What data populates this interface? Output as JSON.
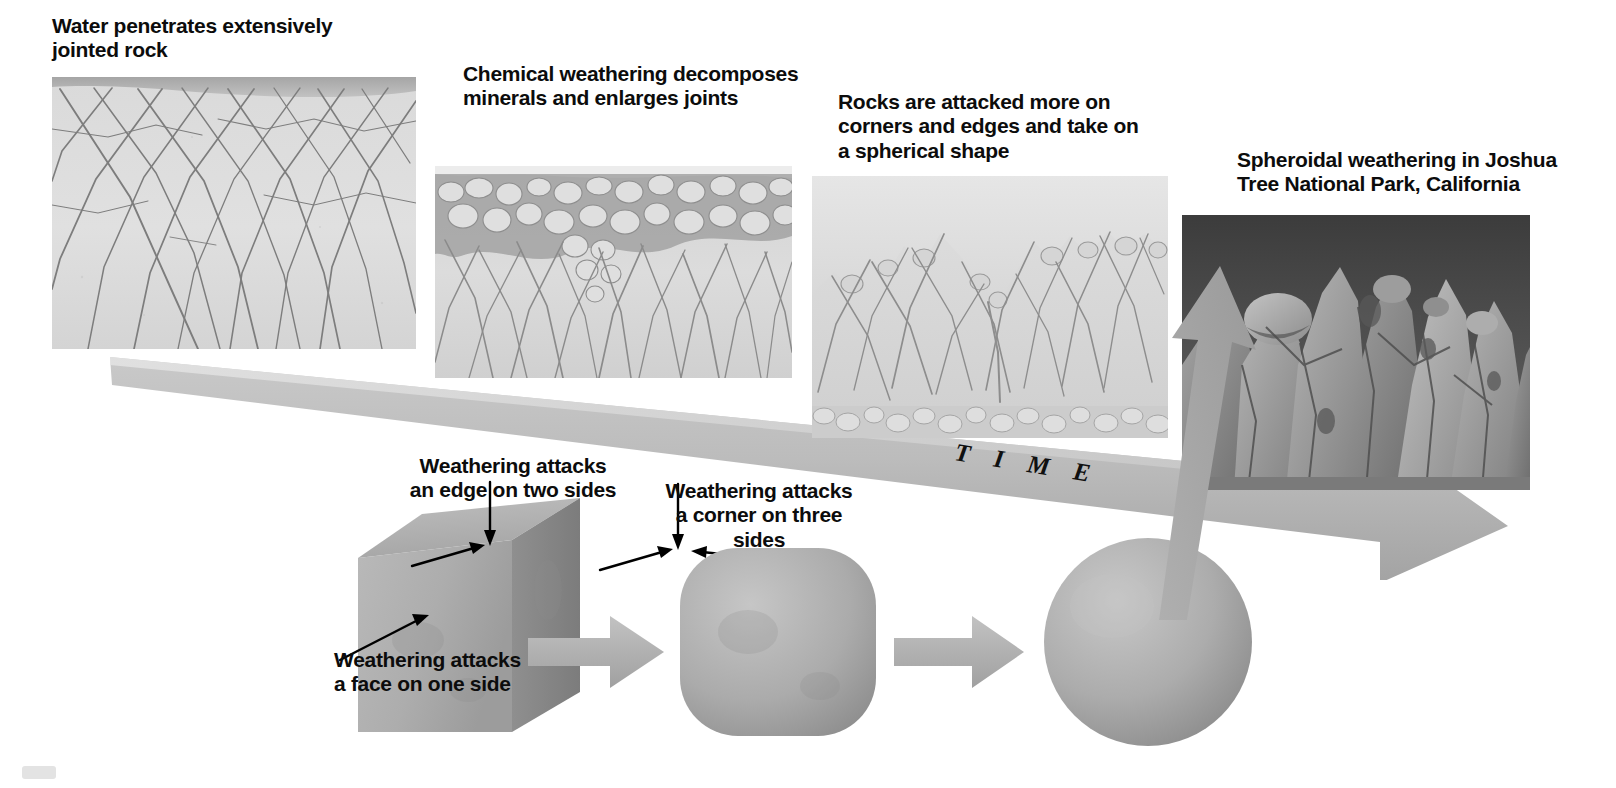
{
  "figure": {
    "time_axis_label": "T I M E"
  },
  "stages": [
    {
      "id": "stage-1",
      "caption": "Water penetrates extensively\njointed rock",
      "image_kind": "jointed-rock-cross-section"
    },
    {
      "id": "stage-2",
      "caption": "Chemical weathering decomposes\nminerals and enlarges joints",
      "image_kind": "enlarged-joints-cross-section"
    },
    {
      "id": "stage-3",
      "caption": "Rocks are attacked more on\ncorners and edges and take on\na spherical shape",
      "image_kind": "rounded-blocks-cross-section"
    },
    {
      "id": "stage-4",
      "caption": "Spheroidal weathering in Joshua\nTree National Park, California",
      "image_kind": "photograph-granite-domes"
    }
  ],
  "cube_annotations": [
    {
      "id": "edge-annotation",
      "text": "Weathering attacks\nan edge on two sides"
    },
    {
      "id": "corner-annotation",
      "text": "Weathering attacks\na corner on three sides"
    },
    {
      "id": "face-annotation",
      "text": "Weathering attacks\na face on one side"
    }
  ],
  "shape_sequence": [
    {
      "id": "shape-cube",
      "name": "cube"
    },
    {
      "id": "shape-rounded-cube",
      "name": "rounded-cube"
    },
    {
      "id": "shape-sphere",
      "name": "sphere"
    }
  ],
  "colors": {
    "text": "#0c0c0c",
    "background": "#ffffff",
    "arrow_gray": "#b3b3b3",
    "arrow_gray_dark": "#9a9a9a",
    "rock_light": "#dcdcdc",
    "rock_mid": "#b8b8b8",
    "rock_dark": "#8a8a8a",
    "joint_line": "#6f6f6f",
    "photo_sky": "#4c4c4c",
    "page_mark": "#e3e3e3"
  }
}
